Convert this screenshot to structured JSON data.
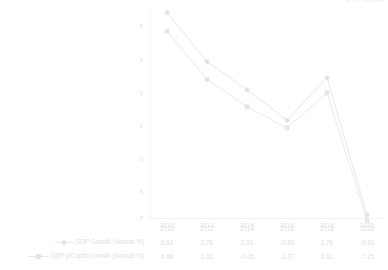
{
  "top_partial_text": "GDP Growth",
  "chart_data": {
    "type": "line",
    "title": "",
    "subtitle": "",
    "xlabel": "",
    "ylabel": "",
    "categories": [
      "2010",
      "2012",
      "2014",
      "2016",
      "2018",
      "2020"
    ],
    "series": [
      {
        "name": "GDP Growth (Annual %)",
        "marker": "circle",
        "color": "#e3e3e6",
        "values": [
          5.84,
          2.78,
          1.01,
          -0.89,
          1.76,
          -6.81
        ]
      },
      {
        "name": "GDP p/Capita Growth (Annual %)",
        "marker": "square",
        "color": "#e6e6e9",
        "values": [
          4.68,
          1.66,
          -0.05,
          -1.37,
          0.82,
          -7.15
        ]
      }
    ],
    "yticks": [
      "5",
      "3",
      "1",
      "-1",
      "-3",
      "-5",
      "-7"
    ],
    "ylim": [
      -8,
      6.6
    ],
    "xlim": [
      0,
      5
    ],
    "grid": false,
    "legend_position": "bottom-left",
    "data_table_visible": true
  },
  "data_table": {
    "header": [
      "",
      "2010",
      "2012",
      "2014",
      "2016",
      "2018",
      "2020"
    ],
    "rows": [
      {
        "label": "GDP Growth (Annual %)",
        "marker": "circle",
        "values": [
          "5.84",
          "2.78",
          "1.01",
          "-0.89",
          "1.76",
          "-6.81"
        ]
      },
      {
        "label": "GDP p/Capita Growth (Annual %)",
        "marker": "square",
        "values": [
          "4.68",
          "1.66",
          "-0.05",
          "-1.37",
          "0.82",
          "-7.15"
        ]
      }
    ]
  },
  "colors": {
    "series_1": "#e3e3e6",
    "series_2": "#e6e6e9",
    "axis": "#ececee",
    "text": "#e0e0e3",
    "background": "#ffffff"
  }
}
